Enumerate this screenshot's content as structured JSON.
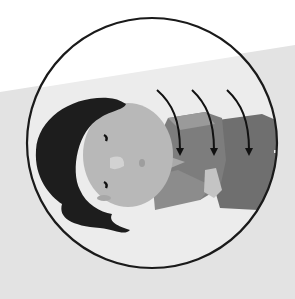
{
  "illustration": {
    "subject": "woman lying on her side",
    "arrows": [
      {
        "label": "arrow-1"
      },
      {
        "label": "arrow-2"
      },
      {
        "label": "arrow-3"
      }
    ],
    "colors": {
      "background_top": "#ffffff",
      "background_band": "#e4e4e4",
      "circle_fill": "#ececec",
      "circle_stroke": "#1a1a1a",
      "hair": "#1c1c1c",
      "skin": "#b9b9b9",
      "skin_shadow": "#a8a8a8",
      "shirt_light": "#8a8a8a",
      "shirt_dark": "#6e6e6e",
      "pants": "#757575",
      "arrow": "#111111"
    }
  }
}
